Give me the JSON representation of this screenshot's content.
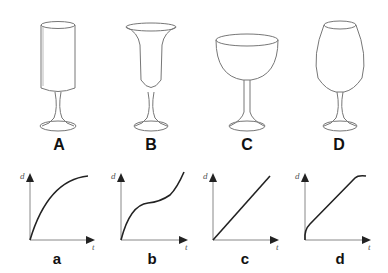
{
  "glasses": [
    {
      "id": "A",
      "shape": "tall cylinder"
    },
    {
      "id": "B",
      "shape": "flared trumpet"
    },
    {
      "id": "C",
      "shape": "wide round bowl"
    },
    {
      "id": "D",
      "shape": "tulip / bulb narrowing at top"
    }
  ],
  "graphs": [
    {
      "id": "a",
      "curve": "concave down, decelerating"
    },
    {
      "id": "b",
      "curve": "rise, plateau, then rise again (S-shape)"
    },
    {
      "id": "c",
      "curve": "straight line"
    },
    {
      "id": "d",
      "curve": "steep start, linear, flattening at top"
    }
  ],
  "axis": {
    "y_label": "d",
    "x_label": "t"
  },
  "colors": {
    "line": "#222222",
    "glass": "#777777"
  }
}
